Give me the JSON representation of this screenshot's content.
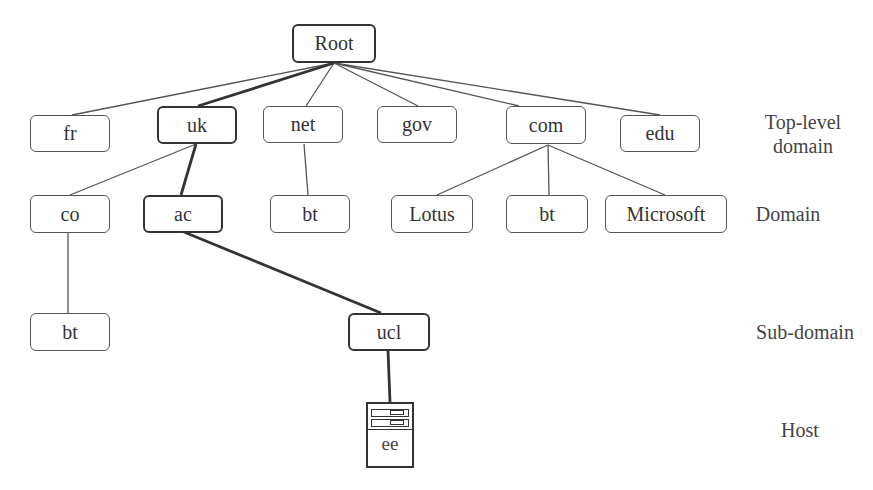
{
  "diagram": {
    "type": "tree",
    "levels": [
      {
        "id": "tld",
        "label": "Top-level\ndomain",
        "line1": "Top-level",
        "line2": "domain"
      },
      {
        "id": "domain",
        "label": "Domain"
      },
      {
        "id": "subdomain",
        "label": "Sub-domain"
      },
      {
        "id": "host",
        "label": "Host"
      }
    ],
    "nodes": {
      "root": {
        "label": "Root",
        "highlighted": true
      },
      "fr": {
        "label": "fr",
        "highlighted": false
      },
      "uk": {
        "label": "uk",
        "highlighted": true
      },
      "net": {
        "label": "net",
        "highlighted": false
      },
      "gov": {
        "label": "gov",
        "highlighted": false
      },
      "com": {
        "label": "com",
        "highlighted": false
      },
      "edu": {
        "label": "edu",
        "highlighted": false
      },
      "co": {
        "label": "co",
        "highlighted": false
      },
      "ac": {
        "label": "ac",
        "highlighted": true
      },
      "net_bt": {
        "label": "bt",
        "highlighted": false
      },
      "lotus": {
        "label": "Lotus",
        "highlighted": false
      },
      "com_bt": {
        "label": "bt",
        "highlighted": false
      },
      "microsoft": {
        "label": "Microsoft",
        "highlighted": false
      },
      "co_bt": {
        "label": "bt",
        "highlighted": false
      },
      "ucl": {
        "label": "ucl",
        "highlighted": true
      },
      "ee": {
        "label": "ee",
        "highlighted": true,
        "icon": "server-icon"
      }
    },
    "edges": [
      {
        "from": "root",
        "to": "fr",
        "highlighted": false
      },
      {
        "from": "root",
        "to": "uk",
        "highlighted": true
      },
      {
        "from": "root",
        "to": "net",
        "highlighted": false
      },
      {
        "from": "root",
        "to": "gov",
        "highlighted": false
      },
      {
        "from": "root",
        "to": "com",
        "highlighted": false
      },
      {
        "from": "root",
        "to": "edu",
        "highlighted": false
      },
      {
        "from": "uk",
        "to": "co",
        "highlighted": false
      },
      {
        "from": "uk",
        "to": "ac",
        "highlighted": true
      },
      {
        "from": "net",
        "to": "net_bt",
        "highlighted": false
      },
      {
        "from": "com",
        "to": "lotus",
        "highlighted": false
      },
      {
        "from": "com",
        "to": "com_bt",
        "highlighted": false
      },
      {
        "from": "com",
        "to": "microsoft",
        "highlighted": false
      },
      {
        "from": "co",
        "to": "co_bt",
        "highlighted": false
      },
      {
        "from": "ac",
        "to": "ucl",
        "highlighted": true
      },
      {
        "from": "ucl",
        "to": "ee",
        "highlighted": true
      }
    ],
    "colors": {
      "line": "#555555",
      "highlight_line": "#333333",
      "text": "#333333",
      "background": "#ffffff"
    }
  }
}
